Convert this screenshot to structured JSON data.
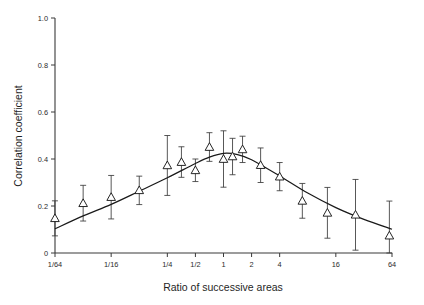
{
  "chart_data": {
    "type": "scatter",
    "title": "",
    "xlabel": "Ratio of successive areas",
    "ylabel": "Correlation coefficient",
    "x_scale": "log2",
    "xlim": [
      0.015625,
      64
    ],
    "ylim": [
      0,
      1.0
    ],
    "y_ticks": [
      "1.0",
      "0.8",
      "0.6",
      "0.4",
      "0.2",
      "0"
    ],
    "y_tick_values": [
      1.0,
      0.8,
      0.6,
      0.4,
      0.2,
      0
    ],
    "x_ticks": [
      "1/64",
      "1/16",
      "1/4",
      "1/2",
      "1",
      "2",
      "4",
      "16",
      "64"
    ],
    "x_tick_values": [
      0.015625,
      0.0625,
      0.25,
      0.5,
      1,
      2,
      4,
      16,
      64
    ],
    "grid": false,
    "legend": "none",
    "marker": "open-triangle",
    "error_bars": "vertical",
    "series": [
      {
        "name": "Correlation coefficient",
        "points": [
          {
            "x": 0.0156,
            "y": 0.148,
            "err_low": 0.073,
            "err_high": 0.222
          },
          {
            "x": 0.0313,
            "y": 0.212,
            "err_low": 0.136,
            "err_high": 0.288
          },
          {
            "x": 0.0625,
            "y": 0.238,
            "err_low": 0.145,
            "err_high": 0.33
          },
          {
            "x": 0.125,
            "y": 0.267,
            "err_low": 0.206,
            "err_high": 0.327
          },
          {
            "x": 0.25,
            "y": 0.373,
            "err_low": 0.245,
            "err_high": 0.5
          },
          {
            "x": 0.354,
            "y": 0.387,
            "err_low": 0.322,
            "err_high": 0.452
          },
          {
            "x": 0.5,
            "y": 0.352,
            "err_low": 0.304,
            "err_high": 0.4
          },
          {
            "x": 0.707,
            "y": 0.451,
            "err_low": 0.39,
            "err_high": 0.512
          },
          {
            "x": 1.0,
            "y": 0.4,
            "err_low": 0.28,
            "err_high": 0.52
          },
          {
            "x": 1.25,
            "y": 0.411,
            "err_low": 0.333,
            "err_high": 0.488
          },
          {
            "x": 1.6,
            "y": 0.441,
            "err_low": 0.385,
            "err_high": 0.497
          },
          {
            "x": 2.5,
            "y": 0.374,
            "err_low": 0.3,
            "err_high": 0.447
          },
          {
            "x": 4.0,
            "y": 0.325,
            "err_low": 0.265,
            "err_high": 0.385
          },
          {
            "x": 7.0,
            "y": 0.222,
            "err_low": 0.148,
            "err_high": 0.296
          },
          {
            "x": 13.0,
            "y": 0.171,
            "err_low": 0.063,
            "err_high": 0.279
          },
          {
            "x": 26.0,
            "y": 0.163,
            "err_low": 0.012,
            "err_high": 0.313
          },
          {
            "x": 60.0,
            "y": 0.074,
            "err_low": 0.0,
            "err_high": 0.221
          }
        ]
      }
    ],
    "fit_curve": {
      "name": "fitted trend",
      "points": [
        {
          "x": 0.0156,
          "y": 0.103
        },
        {
          "x": 0.0313,
          "y": 0.158
        },
        {
          "x": 0.0625,
          "y": 0.207
        },
        {
          "x": 0.125,
          "y": 0.263
        },
        {
          "x": 0.25,
          "y": 0.32
        },
        {
          "x": 0.5,
          "y": 0.381
        },
        {
          "x": 0.707,
          "y": 0.408
        },
        {
          "x": 1.0,
          "y": 0.424
        },
        {
          "x": 1.414,
          "y": 0.419
        },
        {
          "x": 2.0,
          "y": 0.397
        },
        {
          "x": 4.0,
          "y": 0.328
        },
        {
          "x": 8.0,
          "y": 0.255
        },
        {
          "x": 16.0,
          "y": 0.193
        },
        {
          "x": 32.0,
          "y": 0.143
        },
        {
          "x": 64.0,
          "y": 0.101
        }
      ]
    }
  },
  "caption": {
    "partial_text": ""
  }
}
